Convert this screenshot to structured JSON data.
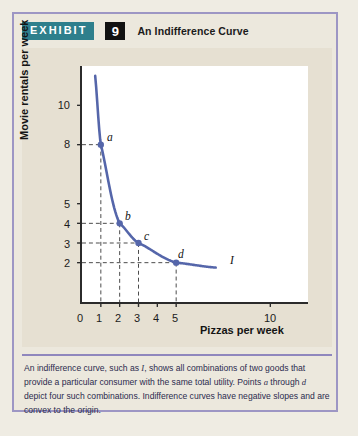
{
  "exhibit": {
    "tag_label": "EXHIBIT",
    "number": "9",
    "title": "An Indifference Curve",
    "tag_color": "#2e7f8c",
    "number_bg": "#111111",
    "border_color": "#9d96c4",
    "panel_bg": "#e6e0d2"
  },
  "caption": {
    "part1": "An indifference curve, such as ",
    "curve_ref": "I",
    "part2": ", shows all combinations of two goods that provide a particular consumer with the same total utility. Points ",
    "point_a_ref": "a",
    "part3": " through ",
    "point_d_ref": "d",
    "part4": " depict four such combinations. Indifference curves have negative slopes and are convex to the origin."
  },
  "chart_data": {
    "type": "line",
    "title": "An Indifference Curve",
    "xlabel": "Pizzas per week",
    "ylabel": "Movie rentals per week",
    "xlim": [
      0,
      12
    ],
    "ylim": [
      0,
      12
    ],
    "grid": false,
    "curve_color": "#5566aa",
    "x_ticks": [
      0,
      1,
      2,
      3,
      4,
      5,
      10
    ],
    "x_tick_labels": [
      "0",
      "1",
      "2",
      "3",
      "4",
      "5",
      "10"
    ],
    "y_ticks": [
      2,
      3,
      4,
      5,
      8,
      10
    ],
    "y_tick_labels": [
      "2",
      "3",
      "4",
      "5",
      "8",
      "10"
    ],
    "series": [
      {
        "name": "I",
        "label": "I",
        "points": [
          {
            "label": "a",
            "x": 1,
            "y": 8
          },
          {
            "label": "b",
            "x": 2,
            "y": 4
          },
          {
            "label": "c",
            "x": 3,
            "y": 3
          },
          {
            "label": "d",
            "x": 5,
            "y": 2
          }
        ],
        "curve_endpoints": {
          "x_start": 0.7,
          "y_start": 11.5,
          "x_end": 7.1,
          "y_end": 1.75
        }
      }
    ],
    "annotations": [
      {
        "text": "a",
        "x": 1,
        "y": 8
      },
      {
        "text": "b",
        "x": 2,
        "y": 4
      },
      {
        "text": "c",
        "x": 3,
        "y": 3
      },
      {
        "text": "d",
        "x": 5,
        "y": 2
      },
      {
        "text": "I",
        "x": 7.9,
        "y": 2.05
      }
    ]
  }
}
